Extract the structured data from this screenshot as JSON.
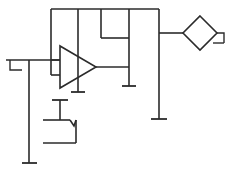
{
  "diagram": {
    "title": "Amplifier schematic fragment",
    "type": "electrical-schematic",
    "canvas": {
      "width": 227,
      "height": 170,
      "background": "#ffffff"
    },
    "style": {
      "line_color": "#2b2b2b",
      "line_width": 1.6
    },
    "components": [
      {
        "id": "amplifier",
        "name": "triangle-amplifier",
        "label": "",
        "shape": "triangle",
        "apex_x": 96,
        "top_y": 46,
        "bottom_y": 88,
        "left_x": 60
      },
      {
        "id": "diamond",
        "name": "diamond-node",
        "label": "",
        "shape": "diamond",
        "center_x": 200,
        "center_y": 33,
        "radius": 17
      },
      {
        "id": "bracket",
        "name": "u-bracket-element",
        "label": "",
        "shape": "u-bracket",
        "left_x": 43,
        "right_x": 76,
        "top_y": 120,
        "bottom_y": 143
      },
      {
        "id": "top-box",
        "name": "inner-rectangle",
        "label": "",
        "shape": "open-rectangle",
        "left_x": 101,
        "right_x": 129,
        "top_y": 10,
        "bottom_y": 38
      }
    ],
    "grounds": [
      {
        "id": "ground-amp-bottom",
        "name": "ground-symbol-amp",
        "x": 78,
        "y": 92,
        "width": 13
      },
      {
        "id": "ground-mid",
        "name": "ground-symbol-mid",
        "x": 129,
        "y": 86,
        "width": 13
      },
      {
        "id": "ground-right",
        "name": "ground-symbol-right",
        "x": 159,
        "y": 119,
        "width": 15
      },
      {
        "id": "ground-left",
        "name": "ground-symbol-left",
        "x": 29,
        "y": 163,
        "width": 15
      }
    ],
    "terminals": [
      {
        "id": "terminal-left",
        "name": "terminal-left-input",
        "label": "",
        "x": 6,
        "y": 60
      },
      {
        "id": "terminal-right",
        "name": "terminal-right-output",
        "label": "",
        "x": 218,
        "y": 33
      }
    ],
    "nets": [
      {
        "id": "net-top-rail",
        "name": "top-rail-wire"
      },
      {
        "id": "net-input",
        "name": "input-wire"
      },
      {
        "id": "net-output",
        "name": "output-wire"
      },
      {
        "id": "net-feedback",
        "name": "feedback-wire"
      },
      {
        "id": "net-ground",
        "name": "ground-wire"
      }
    ]
  }
}
